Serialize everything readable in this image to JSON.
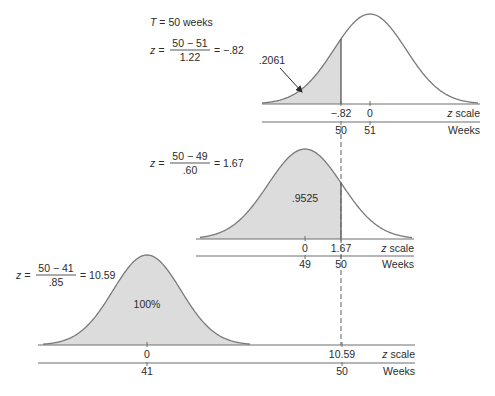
{
  "header": {
    "T_label": "T = 50 weeks",
    "T_var": "T",
    "T_rest": " = 50 weeks"
  },
  "formulas": [
    {
      "lhs": "z =",
      "numerator": "50 − 51",
      "denominator": "1.22",
      "rhs": "= −.82",
      "x": 150,
      "y": 47
    },
    {
      "lhs": "z =",
      "numerator": "50 − 49",
      "denominator": ".60",
      "rhs": "= 1.67",
      "x": 150,
      "y": 160
    },
    {
      "lhs": "z =",
      "numerator": "50 − 41",
      "denominator": ".85",
      "rhs": "= 10.59",
      "x": 16,
      "y": 272
    }
  ],
  "panels": [
    {
      "name": "top",
      "mean_x": 370,
      "sd_px": 36,
      "peak_y": 14,
      "base_y": 104,
      "weeks_y": 122,
      "curve_x0": 262,
      "curve_x1": 478,
      "line_x0": 262,
      "line_x1": 480,
      "cut_x": 341,
      "shade": "left",
      "area_label": ".2061",
      "area_label_x": 272,
      "area_label_y": 64,
      "arrow": true,
      "z_ticks": [
        {
          "x": 341,
          "label": "−.82"
        },
        {
          "x": 370,
          "label": "0"
        }
      ],
      "week_ticks": [
        {
          "x": 341,
          "label": "50"
        },
        {
          "x": 370,
          "label": "51"
        }
      ],
      "z_axis_label": "z scale",
      "weeks_axis_label": "Weeks"
    },
    {
      "name": "middle",
      "mean_x": 305,
      "sd_px": 37,
      "peak_y": 149,
      "base_y": 239,
      "weeks_y": 256,
      "curve_x0": 200,
      "curve_x1": 412,
      "line_x0": 196,
      "line_x1": 414,
      "cut_x": 341,
      "shade": "left",
      "area_label": ".9525",
      "area_label_x": 305,
      "area_label_y": 202,
      "arrow": false,
      "z_ticks": [
        {
          "x": 305,
          "label": "0"
        },
        {
          "x": 341,
          "label": "1.67"
        }
      ],
      "week_ticks": [
        {
          "x": 305,
          "label": "49"
        },
        {
          "x": 341,
          "label": "50"
        }
      ],
      "z_axis_label": "z scale",
      "weeks_axis_label": "Weeks"
    },
    {
      "name": "bottom",
      "mean_x": 147,
      "sd_px": 34,
      "peak_y": 255,
      "base_y": 345,
      "weeks_y": 363,
      "curve_x0": 43,
      "curve_x1": 250,
      "line_x0": 38,
      "line_x1": 415,
      "cut_x": null,
      "shade": "all",
      "area_label": "100%",
      "area_label_x": 147,
      "area_label_y": 308,
      "arrow": false,
      "z_ticks": [
        {
          "x": 147,
          "label": "0"
        },
        {
          "x": 342,
          "label": "10.59"
        }
      ],
      "week_ticks": [
        {
          "x": 147,
          "label": "41"
        },
        {
          "x": 342,
          "label": "50"
        }
      ],
      "z_axis_label": "z scale",
      "weeks_axis_label": "Weeks"
    }
  ],
  "dashed_line": {
    "x": 341,
    "y0": 126,
    "y1": 345
  },
  "colors": {
    "fill": "#dcdcdc",
    "curve": "#7a7a7a",
    "axis": "#6e6e6e",
    "text": "#2b2b2b"
  },
  "chart_data": {
    "type": "area",
    "series": [
      {
        "name": "Path 1 (mean 51, sd 1.22)",
        "mean_weeks": 51,
        "sd_weeks": 1.22,
        "z": -0.82,
        "probability": 0.2061
      },
      {
        "name": "Path 2 (mean 49, sd .60)",
        "mean_weeks": 49,
        "sd_weeks": 0.6,
        "z": 1.67,
        "probability": 0.9525
      },
      {
        "name": "Path 3 (mean 41, sd .85)",
        "mean_weeks": 41,
        "sd_weeks": 0.85,
        "z": 10.59,
        "probability": 1.0
      }
    ],
    "xlabel": "Weeks / z scale",
    "annotations": [
      ".2061",
      ".9525",
      "100%"
    ]
  }
}
